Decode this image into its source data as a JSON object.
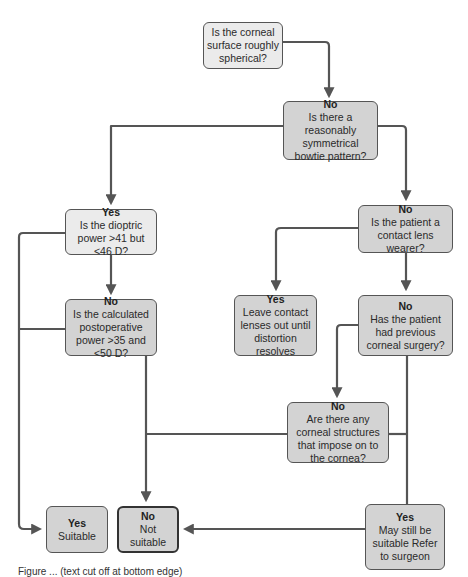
{
  "diagram": {
    "type": "flowchart",
    "colors": {
      "line": "#555555",
      "node_light": "#ebebeb",
      "node_dark": "#d3d3d3",
      "node_border": "#555555"
    },
    "nodes": {
      "corneal_surface": {
        "head": "",
        "body": "Is the corneal surface roughly spherical?"
      },
      "bowtie": {
        "head": "No",
        "body": "Is there a reasonably symmetrical bowtie pattern?"
      },
      "dioptric_power": {
        "head": "Yes",
        "body": "Is the dioptric power >41 but <46 D?"
      },
      "postop_power": {
        "head": "No",
        "body": "Is the calculated postoperative power >35 and <50 D?"
      },
      "contact_lens": {
        "head": "No",
        "body": "Is the patient a contact lens wearer?"
      },
      "leave_lenses_out": {
        "head": "Yes",
        "body": "Leave contact lenses out until distortion resolves"
      },
      "previous_surgery": {
        "head": "No",
        "body": "Has the patient had previous corneal surgery?"
      },
      "corneal_structures": {
        "head": "No",
        "body": "Are there any corneal structures that impose on to the cornea?"
      },
      "suitable": {
        "head": "Yes",
        "body": "Suitable"
      },
      "not_suitable": {
        "head": "No",
        "body": "Not suitable"
      },
      "refer_surgeon": {
        "head": "Yes",
        "body": "May still be suitable Refer to surgeon"
      }
    },
    "edges": [
      {
        "from": "corneal_surface",
        "to": "bowtie",
        "label": "No"
      },
      {
        "from": "corneal_surface",
        "to": "dioptric_power",
        "label": "Yes"
      },
      {
        "from": "bowtie",
        "to": "dioptric_power",
        "label": "Yes"
      },
      {
        "from": "bowtie",
        "to": "contact_lens",
        "label": "No"
      },
      {
        "from": "dioptric_power",
        "to": "suitable",
        "label": "Yes"
      },
      {
        "from": "dioptric_power",
        "to": "postop_power",
        "label": "No"
      },
      {
        "from": "postop_power",
        "to": "suitable",
        "label": "Yes"
      },
      {
        "from": "postop_power",
        "to": "not_suitable",
        "label": "No"
      },
      {
        "from": "contact_lens",
        "to": "leave_lenses_out",
        "label": "Yes"
      },
      {
        "from": "contact_lens",
        "to": "previous_surgery",
        "label": "No"
      },
      {
        "from": "previous_surgery",
        "to": "corneal_structures",
        "label": "No"
      },
      {
        "from": "previous_surgery",
        "to": "refer_surgeon",
        "label": "Yes"
      },
      {
        "from": "corneal_structures",
        "to": "not_suitable",
        "label": "Yes"
      },
      {
        "from": "corneal_structures",
        "to": "refer_surgeon",
        "label": "No"
      },
      {
        "from": "refer_surgeon",
        "to": "not_suitable",
        "label": ""
      }
    ]
  },
  "caption": "Figure ... (text cut off at bottom edge)"
}
